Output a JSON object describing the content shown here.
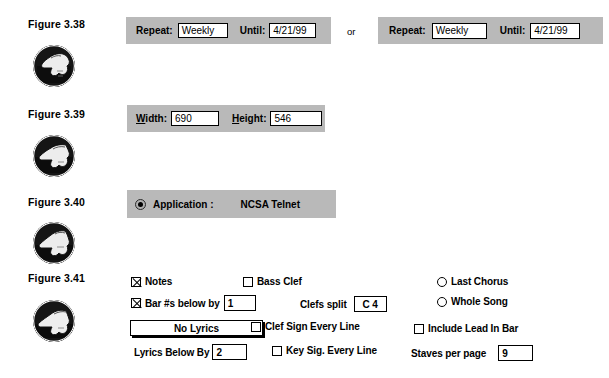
{
  "page": {
    "background": "#ffffff",
    "panel_color": "#b9b9b9",
    "text_color": "#000000"
  },
  "figures": [
    {
      "label": "Figure 3.38",
      "icon": "thumbs-down-icon",
      "panels": [
        {
          "repeat_label": "Repeat:",
          "repeat_value": "Weekly",
          "until_label": "Until:",
          "until_value": "4/21/99"
        },
        {
          "repeat_label": "Repeat:",
          "repeat_value": "Weekly",
          "until_label": "Until:",
          "until_value": "4/21/99"
        }
      ],
      "separator": "or"
    },
    {
      "label": "Figure 3.39",
      "icon": "thumbs-down-icon",
      "width_label_prefix": "W",
      "width_label_rest": "idth:",
      "width_value": "690",
      "height_label_prefix": "H",
      "height_label_rest": "eight:",
      "height_value": "546"
    },
    {
      "label": "Figure 3.40",
      "icon": "thumbs-down-icon",
      "application_label": "Application :",
      "application_value": "NCSA Telnet",
      "radio_selected": true
    },
    {
      "label": "Figure 3.41",
      "icon": "thumbs-down-icon",
      "controls": {
        "notes": {
          "label": "Notes",
          "checked": true
        },
        "bass_clef": {
          "label": "Bass Clef",
          "checked": false
        },
        "bar_numbers": {
          "label": "Bar #s below by",
          "checked": true,
          "value": "1"
        },
        "clefs_split": {
          "label": "Clefs split",
          "value": "C 4"
        },
        "no_lyrics_button": {
          "label": "No Lyrics"
        },
        "clef_sign_every_line": {
          "label": "Clef Sign Every Line",
          "checked": false
        },
        "lyrics_below_by": {
          "label": "Lyrics Below By",
          "value": "2"
        },
        "key_sig_every_line": {
          "label": "Key Sig. Every Line",
          "checked": false
        },
        "last_chorus": {
          "label": "Last Chorus",
          "selected": false
        },
        "whole_song": {
          "label": "Whole Song",
          "selected": false
        },
        "include_lead_in_bar": {
          "label": "Include Lead In Bar",
          "checked": false
        },
        "staves_per_page": {
          "label": "Staves per page",
          "value": "9"
        }
      }
    }
  ]
}
